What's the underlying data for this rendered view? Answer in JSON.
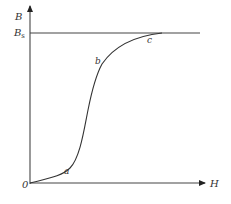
{
  "diagram": {
    "type": "magnetization-curve",
    "axes": {
      "y_label": "B",
      "x_label": "H",
      "origin_label": "0"
    },
    "saturation": {
      "label_main": "B",
      "label_sub": "s"
    },
    "curve_points": {
      "a": "a",
      "b": "b",
      "c": "c"
    },
    "colors": {
      "line": "#333333",
      "background": "#ffffff"
    }
  }
}
